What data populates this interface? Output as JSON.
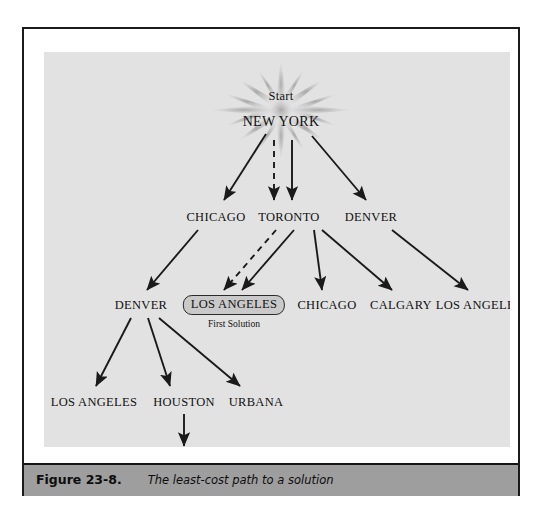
{
  "figure": {
    "caption_number": "Figure 23-8.",
    "caption_text": "The least-cost path to a solution"
  },
  "diagram": {
    "start_label": "Start",
    "solution_note": "First Solution",
    "nodes": [
      {
        "id": "root",
        "label": "NEW YORK",
        "x": 237,
        "y": 70,
        "kind": "root"
      },
      {
        "id": "l1-chicago",
        "label": "CHICAGO",
        "x": 172,
        "y": 165,
        "kind": "city"
      },
      {
        "id": "l1-toronto",
        "label": "TORONTO",
        "x": 245,
        "y": 165,
        "kind": "city"
      },
      {
        "id": "l1-denver",
        "label": "DENVER",
        "x": 327,
        "y": 165,
        "kind": "city"
      },
      {
        "id": "l2-denver",
        "label": "DENVER",
        "x": 97,
        "y": 253,
        "kind": "city"
      },
      {
        "id": "l2-la-sol",
        "label": "LOS ANGELES",
        "x": 190,
        "y": 253,
        "kind": "solution"
      },
      {
        "id": "l2-chicago",
        "label": "CHICAGO",
        "x": 283,
        "y": 253,
        "kind": "city"
      },
      {
        "id": "l2-calgary",
        "label": "CALGARY",
        "x": 357,
        "y": 253,
        "kind": "city"
      },
      {
        "id": "l2-la-right",
        "label": "LOS ANGELES",
        "x": 435,
        "y": 253,
        "kind": "city"
      },
      {
        "id": "l3-la",
        "label": "LOS ANGELES",
        "x": 50,
        "y": 350,
        "kind": "city"
      },
      {
        "id": "l3-houston",
        "label": "HOUSTON",
        "x": 140,
        "y": 350,
        "kind": "city"
      },
      {
        "id": "l3-urbana",
        "label": "URBANA",
        "x": 212,
        "y": 350,
        "kind": "city"
      },
      {
        "id": "l4-la",
        "label": "LOS ANGELES",
        "x": 140,
        "y": 409,
        "kind": "city"
      }
    ],
    "edges": [
      {
        "from": "root",
        "to": "l1-chicago",
        "style": "solid"
      },
      {
        "from": "root",
        "to": "l1-toronto",
        "style": "dashed"
      },
      {
        "from": "root",
        "to": "l1-toronto",
        "style": "solid"
      },
      {
        "from": "root",
        "to": "l1-denver",
        "style": "solid"
      },
      {
        "from": "l1-chicago",
        "to": "l2-denver",
        "style": "solid"
      },
      {
        "from": "l1-toronto",
        "to": "l2-la-sol",
        "style": "dashed"
      },
      {
        "from": "l1-toronto",
        "to": "l2-la-sol",
        "style": "solid"
      },
      {
        "from": "l1-toronto",
        "to": "l2-chicago",
        "style": "solid"
      },
      {
        "from": "l1-toronto",
        "to": "l2-calgary",
        "style": "solid"
      },
      {
        "from": "l1-denver",
        "to": "l2-la-right",
        "style": "solid"
      },
      {
        "from": "l2-denver",
        "to": "l3-la",
        "style": "solid"
      },
      {
        "from": "l2-denver",
        "to": "l3-houston",
        "style": "solid"
      },
      {
        "from": "l2-denver",
        "to": "l3-urbana",
        "style": "solid"
      },
      {
        "from": "l3-houston",
        "to": "l4-la",
        "style": "solid"
      }
    ],
    "colors": {
      "panel_background": "#e2e2e2",
      "arrow": "#1a1a1a",
      "solution_fill": "#c9c9c9",
      "caption_bar": "#9e9e9e",
      "frame": "#1b1b1b"
    }
  }
}
